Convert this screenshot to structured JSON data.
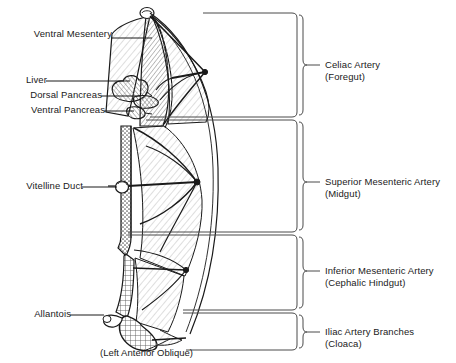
{
  "figure": {
    "caption": "(Left Anterior Oblique)",
    "view": "left anterior oblique",
    "background_color": "#ffffff",
    "ink_color": "#1a1a1a",
    "hatch_color": "#b8b8b8"
  },
  "left_labels": [
    {
      "id": "ventral-mesentery",
      "text": "Ventral Mesentery",
      "x": 12,
      "y": 33,
      "leader_from_x": 111,
      "leader_to_x": 150,
      "leader_y": 38
    },
    {
      "id": "liver",
      "text": "Liver",
      "x": 12,
      "y": 76,
      "leader_from_x": 46,
      "leader_to_x": 128,
      "leader_y": 81
    },
    {
      "id": "dorsal-pancreas",
      "text": "Dorsal Pancreas",
      "x": 12,
      "y": 91,
      "leader_from_x": 101,
      "leader_to_x": 135,
      "leader_y": 96
    },
    {
      "id": "ventral-pancreas",
      "text": "Ventral Pancreas",
      "x": 12,
      "y": 106,
      "leader_from_x": 104,
      "leader_to_x": 133,
      "leader_y": 111
    },
    {
      "id": "vitelline-duct",
      "text": "Vitelline Duct",
      "x": 16,
      "y": 182,
      "leader_from_x": 82,
      "leader_to_x": 121,
      "leader_y": 187
    },
    {
      "id": "allantois",
      "text": "Allantois",
      "x": 16,
      "y": 310,
      "leader_from_x": 70,
      "leader_to_x": 118,
      "leader_y": 315
    }
  ],
  "right_groups": [
    {
      "id": "celiac-artery",
      "title": "Celiac Artery",
      "subtitle": "(Foregut)",
      "brace_top": 12,
      "brace_bottom": 118,
      "tick_y": 64,
      "text_x": 325,
      "title_y": 58,
      "subtitle_y": 70,
      "box_left": 203
    },
    {
      "id": "superior-mesenteric-artery",
      "title": "Superior Mesenteric Artery",
      "subtitle": "(Midgut)",
      "brace_top": 120,
      "brace_bottom": 232,
      "tick_y": 182,
      "text_x": 325,
      "title_y": 176,
      "subtitle_y": 188,
      "box_left": 146
    },
    {
      "id": "inferior-mesenteric-artery",
      "title": "Inferior Mesenteric Artery",
      "subtitle": "(Cephalic Hindgut)",
      "brace_top": 235,
      "brace_bottom": 309,
      "tick_y": 270,
      "text_x": 325,
      "title_y": 264,
      "subtitle_y": 276,
      "box_left": 128
    },
    {
      "id": "iliac-artery-branches",
      "title": "Iliac Artery Branches",
      "subtitle": "(Cloaca)",
      "brace_top": 312,
      "brace_bottom": 350,
      "tick_y": 331,
      "text_x": 325,
      "title_y": 325,
      "subtitle_y": 337,
      "box_left": 183
    }
  ],
  "caption_position": {
    "x": 100,
    "y": 348
  },
  "diagram_regions": [
    {
      "id": "foregut-tube",
      "name": "foregut gut tube"
    },
    {
      "id": "midgut-loop",
      "name": "midgut loop with mesentery fan"
    },
    {
      "id": "hindgut",
      "name": "hindgut"
    },
    {
      "id": "cloaca",
      "name": "cloaca"
    },
    {
      "id": "liver-bud",
      "name": "liver bud"
    },
    {
      "id": "pancreas-buds",
      "name": "dorsal and ventral pancreatic buds"
    },
    {
      "id": "yolk-stalk",
      "name": "vitelline duct / yolk stalk"
    },
    {
      "id": "allantois-duct",
      "name": "allantois"
    }
  ]
}
